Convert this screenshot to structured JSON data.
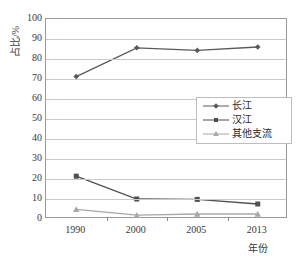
{
  "chart_data": {
    "type": "line",
    "title": "",
    "xlabel": "年份",
    "ylabel": "占比/%",
    "categories": [
      "1990",
      "2000",
      "2005",
      "2013"
    ],
    "x_tick_labels": [
      "1990",
      "2000",
      "2005",
      "2013"
    ],
    "y_tick_labels": [
      "0",
      "10",
      "20",
      "30",
      "40",
      "50",
      "60",
      "70",
      "80",
      "90",
      "100"
    ],
    "ylim": [
      0,
      100
    ],
    "y_step": 10,
    "grid": true,
    "legend_position": "middle-right",
    "series": [
      {
        "name": "长江",
        "marker": "diamond",
        "color": "#5a5a5a",
        "values": [
          71.2,
          85.6,
          84.3,
          86.0
        ]
      },
      {
        "name": "汉江",
        "marker": "square",
        "color": "#4f4f4f",
        "values": [
          21.4,
          10.0,
          9.8,
          7.5
        ]
      },
      {
        "name": "其他支流",
        "marker": "triangle",
        "color": "#a8a8a8",
        "values": [
          4.8,
          1.9,
          2.5,
          2.5
        ]
      }
    ]
  },
  "axis": {
    "y_title": "占比/%",
    "x_title": "年份"
  },
  "colors": {
    "frame": "#9a9a9a",
    "grid": "#c9c9c9",
    "text": "#3a3a3a",
    "background": "#ffffff"
  }
}
